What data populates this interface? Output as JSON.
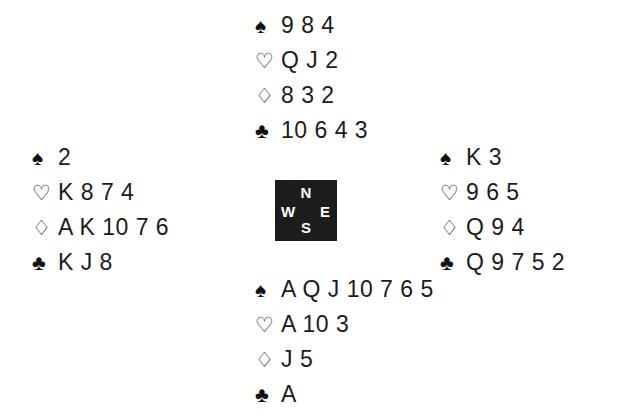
{
  "diagram": {
    "kind": "bridge-deal-diagram",
    "background_color": "#ffffff",
    "text_color": "#1b1b1b"
  },
  "suits": {
    "spade": {
      "name": "spade-suit-symbol",
      "glyph": "♠",
      "filled": true
    },
    "heart": {
      "name": "heart-suit-symbol",
      "glyph": "♡",
      "filled": false
    },
    "diamond": {
      "name": "diamond-suit-symbol",
      "glyph": "♢",
      "filled": false
    },
    "club": {
      "name": "club-suit-symbol",
      "glyph": "♣",
      "filled": true
    }
  },
  "compass": {
    "background_color": "#1c1c1c",
    "text_color": "#ffffff",
    "north": "N",
    "west": "W",
    "east": "E",
    "south": "S"
  },
  "hands": {
    "north": {
      "position": "North",
      "spades": "9 8 4",
      "hearts": "Q J 2",
      "diamonds": "8 3 2",
      "clubs": "10 6 4 3"
    },
    "west": {
      "position": "West",
      "spades": "2",
      "hearts": "K 8 7 4",
      "diamonds": "A K 10 7 6",
      "clubs": "K J 8"
    },
    "east": {
      "position": "East",
      "spades": "K 3",
      "hearts": "9 6 5",
      "diamonds": "Q 9 4",
      "clubs": "Q 9 7 5 2"
    },
    "south": {
      "position": "South",
      "spades": "A Q J 10 7 6 5",
      "hearts": "A 10 3",
      "diamonds": "J 5",
      "clubs": "A"
    }
  }
}
